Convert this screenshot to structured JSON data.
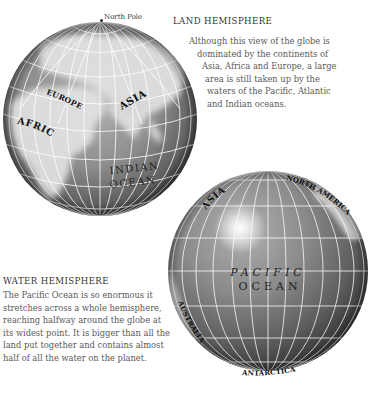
{
  "land_hemisphere": {
    "heading": "LAND HEMISPHERE",
    "body_lines": [
      "Although this view of the globe is",
      "dominated by the continents of",
      "Asia, Africa and Europe, a large",
      "area is still taken up by the",
      "waters of the Pacific, Atlantic",
      "and Indian oceans."
    ],
    "globe_labels": {
      "north_pole": "North Pole",
      "europe": "EUROPE",
      "asia": "ASIA",
      "africa": "AFRICA",
      "ocean_line1": "INDIAN",
      "ocean_line2": "OCEAN"
    }
  },
  "water_hemisphere": {
    "heading": "WATER HEMISPHERE",
    "body_lines": [
      "The Pacific Ocean is so enormous it",
      "stretches across a whole hemisphere,",
      "reaching halfway around the globe at",
      "its widest point. It is bigger than all the",
      "land put together and contains almost",
      "half of all the water on the planet."
    ],
    "globe_labels": {
      "asia": "ASIA",
      "north_america": "NORTH AMERICA",
      "australia": "AUSTRALIA",
      "antarctica": "ANTARCTICA",
      "ocean_line1": "PACIFIC",
      "ocean_line2": "OCEAN"
    }
  },
  "colors": {
    "ocean_light": "#a8a8a8",
    "ocean_dark": "#4a4a4a",
    "land": "#e6e6e6",
    "grid": "#ffffff",
    "heading_text": "#333333",
    "body_text": "#5a5a5a"
  }
}
